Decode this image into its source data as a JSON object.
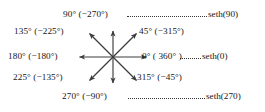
{
  "figure": {
    "background_color": "#ffffff",
    "text_color": "#161616",
    "center": {
      "x": 113,
      "y": 57
    },
    "angle_labels": [
      {
        "key": "a90",
        "text": "90° (−270°)",
        "degrees": 90,
        "alt_degrees": -270,
        "direction": "up"
      },
      {
        "key": "a135",
        "text": "135° (−225°)",
        "degrees": 135,
        "alt_degrees": -225,
        "direction": "up-left"
      },
      {
        "key": "a45",
        "text": "45° (−315°)",
        "degrees": 45,
        "alt_degrees": -315,
        "direction": "up-right"
      },
      {
        "key": "a180",
        "text": "180° (−180°)",
        "degrees": 180,
        "alt_degrees": -180,
        "direction": "left"
      },
      {
        "key": "a0",
        "text": "0° ( 360° )",
        "degrees": 0,
        "alt_degrees": 360,
        "direction": "right"
      },
      {
        "key": "a225",
        "text": "225° (−135°)",
        "degrees": 225,
        "alt_degrees": -135,
        "direction": "down-left"
      },
      {
        "key": "a315",
        "text": "315° (−45°)",
        "degrees": 315,
        "alt_degrees": -45,
        "direction": "down-right"
      },
      {
        "key": "a270",
        "text": "270° (−90°)",
        "degrees": 270,
        "alt_degrees": -90,
        "direction": "down"
      }
    ],
    "callouts": [
      {
        "key": "c90",
        "text": "seth(90)",
        "for_angle": 90
      },
      {
        "key": "c0",
        "text": "seth(0)",
        "for_angle": 0
      },
      {
        "key": "c270",
        "text": "seth(270)",
        "for_angle": 270
      }
    ],
    "arrows": {
      "count": 8,
      "color": "#3d3d3d",
      "style": "solid line with filled arrowhead"
    }
  }
}
